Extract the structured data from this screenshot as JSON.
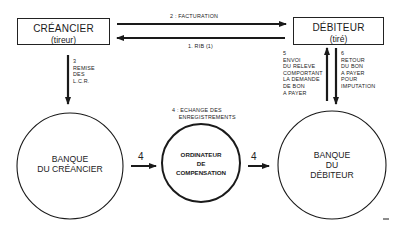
{
  "diagram": {
    "nodes": {
      "creancier": {
        "title": "CRÉANCIER",
        "subtitle": "(tireur)"
      },
      "debiteur": {
        "title": "DÉBITEUR",
        "subtitle": "(tiré)"
      },
      "banque_creancier": {
        "line1": "BANQUE",
        "line2": "DU CRÉANCIER"
      },
      "ordinateur": {
        "line1": "ORDINATEUR",
        "line2": "DE",
        "line3": "COMPENSATION"
      },
      "banque_debiteur": {
        "line1": "BANQUE",
        "line2": "DU",
        "line3": "DÉBITEUR"
      }
    },
    "edges": {
      "facturation": "2 : FACTURATION",
      "rib": "1. RIB (1)",
      "remise": "3\nREMISE\nDES\nL.C.R.",
      "echange": "4 : ECHANGE DES\n    ENREGISTREMENTS",
      "arrow4_left": "4",
      "arrow4_right": "4",
      "envoi": "5\nENVOI\nDU RELEVE\nCOMPORTANT\nLA DEMANDE\nDE BON\nA PAYER",
      "retour": "6\nRETOUR\nDU BON\nA PAYER\nPOUR\nIMPUTATION"
    },
    "colors": {
      "stroke": "#1a1a1a",
      "background": "#ffffff"
    }
  }
}
